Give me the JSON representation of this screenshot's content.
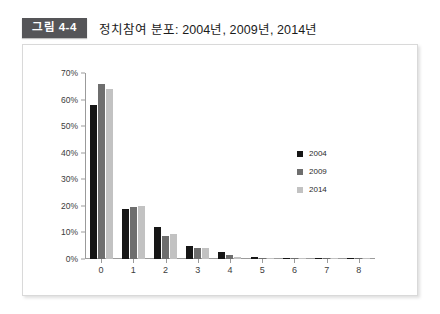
{
  "figure": {
    "badge": "그림 4-4",
    "title": "정치참여 분포: 2004년, 2009년, 2014년"
  },
  "colors": {
    "series_2004": "#161616",
    "series_2009": "#6e6e6e",
    "series_2014": "#c2c2c2",
    "badge_background": "#555558",
    "frame_border": "#d9d9d9",
    "axis": "#9b9b9b"
  },
  "chart_data": {
    "type": "bar",
    "title": "정치참여 분포: 2004년, 2009년, 2014년",
    "xlabel": "",
    "ylabel": "",
    "categories": [
      "0",
      "1",
      "2",
      "3",
      "4",
      "5",
      "6",
      "7",
      "8"
    ],
    "series": [
      {
        "name": "2004",
        "color": "#161616",
        "values": [
          58,
          19,
          12,
          5,
          2.5,
          0.7,
          0.3,
          0.1,
          0.3
        ]
      },
      {
        "name": "2009",
        "color": "#6e6e6e",
        "values": [
          66,
          19.5,
          8.5,
          4,
          1.5,
          0.5,
          0.2,
          0.1,
          0.2
        ]
      },
      {
        "name": "2014",
        "color": "#c2c2c2",
        "values": [
          64,
          20,
          9.5,
          4,
          0.6,
          0.3,
          0.2,
          0.1,
          0.5
        ]
      }
    ],
    "ylim": [
      0,
      70
    ],
    "yticks": [
      "0%",
      "10%",
      "20%",
      "30%",
      "40%",
      "50%",
      "60%",
      "70%"
    ],
    "ytick_values": [
      0,
      10,
      20,
      30,
      40,
      50,
      60,
      70
    ],
    "grid": false,
    "legend_position": "right"
  }
}
